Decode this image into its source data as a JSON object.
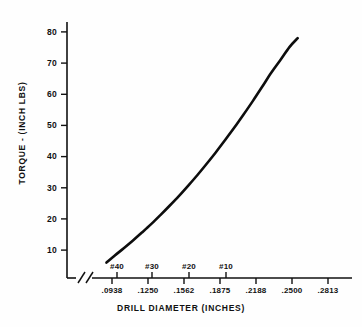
{
  "chart_data": {
    "type": "line",
    "title": "",
    "xlabel": "DRILL DIAMETER (INCHES)",
    "ylabel": "TORQUE - (INCH LBS)",
    "xlim": [
      0.0781,
      0.2969
    ],
    "ylim": [
      0,
      85
    ],
    "grid": false,
    "legend": "none",
    "x_ticks": [
      {
        "value": 0.0938,
        "label": ".0938"
      },
      {
        "value": 0.125,
        "label": ".1250"
      },
      {
        "value": 0.1562,
        "label": ".1562"
      },
      {
        "value": 0.1875,
        "label": ".1875"
      },
      {
        "value": 0.2188,
        "label": ".2188"
      },
      {
        "value": 0.25,
        "label": ".2500"
      },
      {
        "value": 0.2813,
        "label": ".2813"
      }
    ],
    "y_ticks": [
      {
        "value": 10,
        "label": "10"
      },
      {
        "value": 20,
        "label": "20"
      },
      {
        "value": 30,
        "label": "30"
      },
      {
        "value": 40,
        "label": "40"
      },
      {
        "value": 50,
        "label": "50"
      },
      {
        "value": 60,
        "label": "60"
      },
      {
        "value": 70,
        "label": "70"
      },
      {
        "value": 80,
        "label": "80"
      }
    ],
    "drill_size_annotations": [
      {
        "label": "#40",
        "value": 0.098
      },
      {
        "label": "#30",
        "value": 0.1285
      },
      {
        "label": "#20",
        "value": 0.161
      },
      {
        "label": "#10",
        "value": 0.1935
      }
    ],
    "axis_break": {
      "present": true,
      "symbol": "//"
    },
    "series": [
      {
        "name": "torque",
        "x": [
          0.089,
          0.096,
          0.104,
          0.112,
          0.12,
          0.128,
          0.136,
          0.144,
          0.152,
          0.16,
          0.168,
          0.176,
          0.184,
          0.192,
          0.2,
          0.208,
          0.216,
          0.224,
          0.232,
          0.24,
          0.248,
          0.255
        ],
        "y": [
          6.0,
          8.2,
          10.6,
          13.1,
          15.7,
          18.4,
          21.3,
          24.3,
          27.4,
          30.7,
          34.1,
          37.7,
          41.4,
          45.3,
          49.3,
          53.5,
          57.8,
          62.3,
          66.9,
          71.0,
          75.2,
          78.0
        ]
      }
    ]
  },
  "axis_break_symbol": "//"
}
